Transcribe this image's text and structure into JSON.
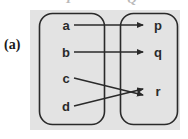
{
  "figure": {
    "caption": "(a)",
    "type": "mapping-diagram",
    "background_color": "#e3e3e3",
    "stroke_color": "#2a2a2a"
  },
  "sets": {
    "left": {
      "name": "P",
      "elements": [
        {
          "id": "a",
          "label": "a"
        },
        {
          "id": "b",
          "label": "b"
        },
        {
          "id": "c",
          "label": "c"
        },
        {
          "id": "d",
          "label": "d"
        }
      ]
    },
    "right": {
      "name": "Q",
      "elements": [
        {
          "id": "p",
          "label": "p"
        },
        {
          "id": "q",
          "label": "q"
        },
        {
          "id": "r",
          "label": "r"
        }
      ]
    }
  },
  "mappings": [
    {
      "from": "a",
      "to": "p"
    },
    {
      "from": "b",
      "to": "q"
    },
    {
      "from": "c",
      "to": "r"
    },
    {
      "from": "d",
      "to": "r"
    }
  ]
}
